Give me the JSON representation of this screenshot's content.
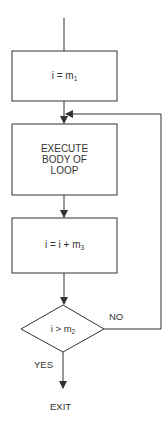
{
  "diagram": {
    "type": "flowchart",
    "title": "",
    "nodes": [
      {
        "id": "init",
        "shape": "rect",
        "text": "i = m",
        "sub": "1"
      },
      {
        "id": "body",
        "shape": "rect",
        "lines": [
          "EXECUTE",
          "BODY OF",
          "LOOP"
        ]
      },
      {
        "id": "incr",
        "shape": "rect",
        "text": "i = i + m",
        "sub": "3"
      },
      {
        "id": "test",
        "shape": "diamond",
        "text": "i > m",
        "sub": "2"
      },
      {
        "id": "exit",
        "shape": "terminal-text",
        "text": "EXIT"
      }
    ],
    "edges": [
      {
        "from": "start",
        "to": "init"
      },
      {
        "from": "init",
        "to": "body"
      },
      {
        "from": "body",
        "to": "incr"
      },
      {
        "from": "incr",
        "to": "test"
      },
      {
        "from": "test",
        "to": "body",
        "label": "NO"
      },
      {
        "from": "test",
        "to": "exit",
        "label": "YES"
      }
    ],
    "labels": {
      "no": "NO",
      "yes": "YES",
      "exit": "EXIT"
    },
    "colors": {
      "line": "#333333",
      "background": "#ffffff"
    }
  }
}
